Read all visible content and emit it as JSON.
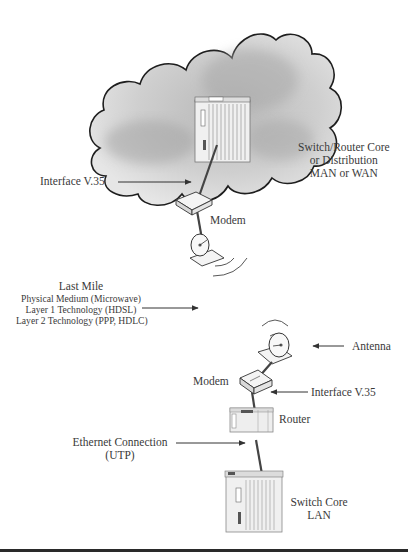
{
  "diagram": {
    "type": "network-topology",
    "cloud": {
      "label_lines": [
        "Switch/Router Core",
        "or Distribution",
        "MAN or WAN"
      ]
    },
    "labels": {
      "upper_interface": "Interface V.35",
      "upper_modem": "Modem",
      "last_mile": {
        "title": "Last Mile",
        "lines": [
          "Physical Medium (Microwave)",
          "Layer 1 Technology (HDSL)",
          "Layer 2 Technology (PPP, HDLC)"
        ]
      },
      "antenna": "Antenna",
      "lower_modem": "Modem",
      "lower_interface": "Interface V.35",
      "router": "Router",
      "ethernet": [
        "Ethernet Connection",
        "(UTP)"
      ],
      "switch_core": [
        "Switch Core",
        "LAN"
      ]
    },
    "nodes": [
      {
        "id": "wan-switch",
        "kind": "chassis-switch",
        "location": "inside cloud"
      },
      {
        "id": "upper-modem",
        "kind": "modem"
      },
      {
        "id": "upper-antenna",
        "kind": "microwave-dish"
      },
      {
        "id": "lower-antenna",
        "kind": "microwave-dish"
      },
      {
        "id": "lower-modem",
        "kind": "modem"
      },
      {
        "id": "router",
        "kind": "router"
      },
      {
        "id": "lan-switch",
        "kind": "chassis-switch"
      }
    ],
    "links": [
      {
        "from": "wan-switch",
        "to": "upper-modem",
        "label": "Interface V.35"
      },
      {
        "from": "upper-modem",
        "to": "upper-antenna"
      },
      {
        "from": "upper-antenna",
        "to": "lower-antenna",
        "label": "Last Mile (Microwave)"
      },
      {
        "from": "lower-antenna",
        "to": "lower-modem"
      },
      {
        "from": "lower-modem",
        "to": "router",
        "label": "Interface V.35"
      },
      {
        "from": "router",
        "to": "lan-switch",
        "label": "Ethernet Connection (UTP)"
      }
    ],
    "colors": {
      "cloud_fill": "#d4d4d4",
      "cloud_outline": "#1e1e1e",
      "device_fill": "#ececec",
      "link": "#444444",
      "text": "#3a3a3a",
      "rule": "#2a2a2a"
    }
  }
}
